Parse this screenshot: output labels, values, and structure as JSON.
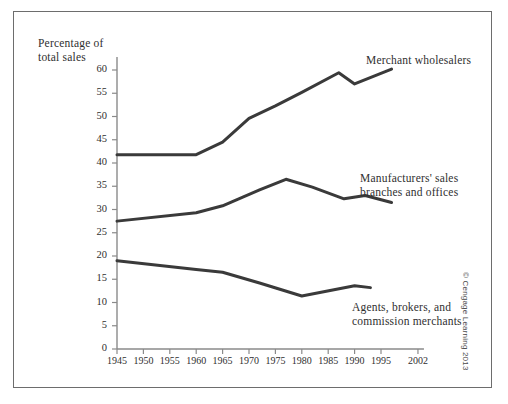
{
  "figure": {
    "copyright": "© Cengage Learning 2013"
  },
  "chart_data": {
    "type": "line",
    "title": "",
    "xlabel": "",
    "ylabel": "Percentage of total sales",
    "ylabel_lines": [
      "Percentage of",
      "total sales"
    ],
    "xlim": [
      1945,
      2002
    ],
    "ylim": [
      0,
      60
    ],
    "grid": false,
    "legend_position": "inline-right",
    "yticks": [
      0,
      5,
      10,
      15,
      20,
      25,
      30,
      35,
      40,
      45,
      50,
      55,
      60
    ],
    "ytick_labels": [
      "0",
      "5",
      "10",
      "15",
      "20",
      "25",
      "30",
      "35",
      "40",
      "45",
      "50",
      "55",
      "60"
    ],
    "xticks": [
      1945,
      1950,
      1955,
      1960,
      1965,
      1970,
      1975,
      1980,
      1985,
      1990,
      1995,
      2002
    ],
    "xtick_labels": [
      "1945",
      "1950",
      "1955",
      "1960",
      "1965",
      "1970",
      "1975",
      "1980",
      "1985",
      "1990",
      "1995",
      "2002"
    ],
    "line_color": "#3a3a3a",
    "series": [
      {
        "name": "Merchant wholesalers",
        "label_lines": [
          "Merchant wholesalers"
        ],
        "x": [
          1945,
          1960,
          1965,
          1970,
          1975,
          1980,
          1987,
          1990,
          1997
        ],
        "values": [
          41.8,
          41.8,
          44.5,
          49.6,
          52.3,
          55.2,
          59.4,
          57.0,
          60.2
        ]
      },
      {
        "name": "Manufacturers' sales branches and offices",
        "label_lines": [
          "Manufacturers' sales",
          "branches and offices"
        ],
        "x": [
          1945,
          1960,
          1965,
          1972,
          1977,
          1982,
          1988,
          1992,
          1997
        ],
        "values": [
          27.5,
          29.3,
          30.8,
          34.2,
          36.5,
          34.8,
          32.3,
          33.0,
          31.5
        ]
      },
      {
        "name": "Agents, brokers, and commission merchants",
        "label_lines": [
          "Agents, brokers, and",
          "commission merchants"
        ],
        "x": [
          1945,
          1960,
          1965,
          1972,
          1980,
          1990,
          1993
        ],
        "values": [
          19.0,
          17.1,
          16.5,
          14.2,
          11.4,
          13.6,
          13.2
        ]
      }
    ]
  }
}
